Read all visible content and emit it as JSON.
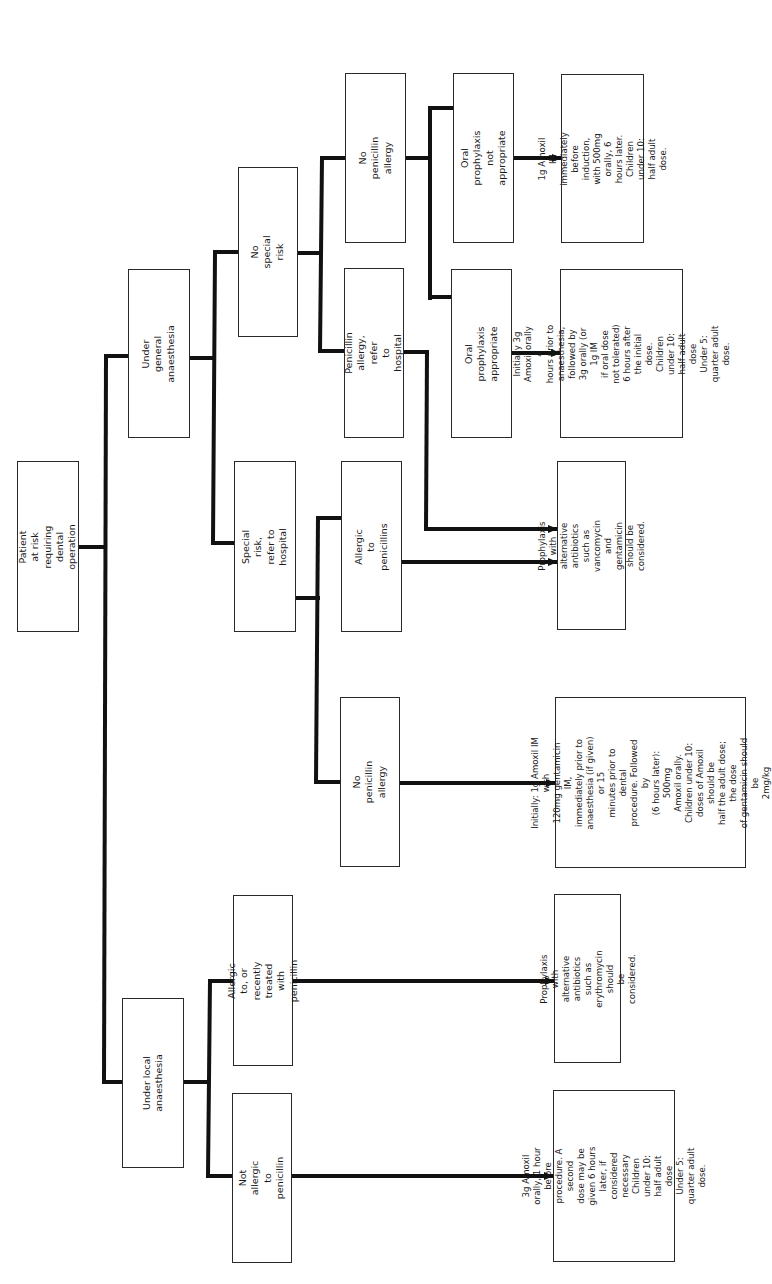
{
  "diagram": {
    "type": "flowchart",
    "orientation": "rotated-90-ccw",
    "title_node": "Patient at risk requiring\ndental operation",
    "nodes": {
      "root": "Patient at risk requiring\ndental operation",
      "general": "Under general anaesthesia",
      "local": "Under local anaesthesia",
      "no_special_risk": "No special risk",
      "special_risk": "Special risk, refer to hospital",
      "gen_no_pen_allergy": "No penicillin allergy",
      "gen_pen_allergy": "Penicillin allergy, refer\nto hospital",
      "spec_allergic": "Allergic to penicillins",
      "spec_no_allergy": "No penicillin allergy",
      "local_allergic": "Allergic to, or recently treated\nwith penicillin",
      "local_not_allergic": "Not allergic to penicillin",
      "oral_not_appropriate": "Oral prophylaxis\nnot appropriate",
      "oral_appropriate": "Oral prophylaxis appropriate"
    },
    "outcomes": {
      "im_amoxil": "1g Amoxil IM immediately\nbefore induction, with 500mg\norally, 6 hours later.\nChildren under 10:\nhalf adult dose.",
      "oral_amoxil": "Initially 3g Amoxil orally 4\nhours prior to anaesthesia,\nfollowed by 3g orally (or 1g IM\nif oral dose not tolerated)\n6 hours after the initial dose.\nChildren under 10:\nhalf adult dose\nUnder 5: quarter adult dose.",
      "vancomycin": "Prophylaxis with alternative\nantibiotics such as\nvancomycin and gentamicin\nshould be considered.",
      "gentamicin": "Initially: 1g Amoxil IM with\n120mg gentamicin IM,\nimmediately prior to\nanaesthesia (if given) or 15\nminutes prior to dental\nprocedure. Followed by\n(6 hours later): 500mg\nAmoxil orally.\nChildren under 10:\ndoses of Amoxil should be\nhalf the adult dose; the dose\nof gentamicin should be\n2mg/kg",
      "erythromycin": "Prophylaxis with alternative\nantibiotics such as\nerythromycin should\nbe considered.",
      "local_amoxil": "3g Amoxil orally, 1 hour\nbefore procedure. A second\ndose may be given 6 hours\nlater, if considered\nnecessary\nChildren under 10:\nhalf adult dose\nUnder 5: quarter adult dose."
    },
    "edges": [
      [
        "root",
        "general"
      ],
      [
        "root",
        "local"
      ],
      [
        "general",
        "no_special_risk"
      ],
      [
        "general",
        "special_risk"
      ],
      [
        "no_special_risk",
        "gen_no_pen_allergy"
      ],
      [
        "no_special_risk",
        "gen_pen_allergy"
      ],
      [
        "gen_no_pen_allergy",
        "oral_not_appropriate"
      ],
      [
        "gen_no_pen_allergy",
        "oral_appropriate"
      ],
      [
        "oral_not_appropriate",
        "im_amoxil"
      ],
      [
        "oral_appropriate",
        "oral_amoxil"
      ],
      [
        "gen_pen_allergy",
        "vancomycin"
      ],
      [
        "special_risk",
        "spec_allergic"
      ],
      [
        "special_risk",
        "spec_no_allergy"
      ],
      [
        "spec_allergic",
        "vancomycin"
      ],
      [
        "spec_no_allergy",
        "gentamicin"
      ],
      [
        "local",
        "local_allergic"
      ],
      [
        "local",
        "local_not_allergic"
      ],
      [
        "local_allergic",
        "erythromycin"
      ],
      [
        "local_not_allergic",
        "local_amoxil"
      ]
    ],
    "colors": {
      "line": "#111111",
      "box_border": "#2a2a2a",
      "background": "#ffffff"
    }
  }
}
